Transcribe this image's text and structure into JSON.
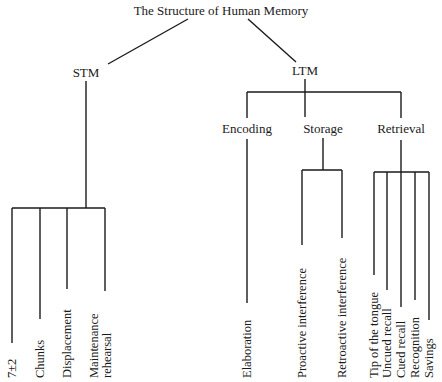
{
  "title": "The Structure of Human Memory",
  "colors": {
    "line": "#1a1a1a",
    "background": "#ffffff"
  },
  "stm": {
    "label": "STM",
    "leaves": [
      "7±2",
      "Chunks",
      "Displacement",
      "Maintenance",
      "rehearsal"
    ]
  },
  "ltm": {
    "label": "LTM",
    "encoding": {
      "label": "Encoding",
      "leaves": [
        "Elaboration"
      ]
    },
    "storage": {
      "label": "Storage",
      "leaves": [
        "Proactive interference",
        "Retroactive interference"
      ]
    },
    "retrieval": {
      "label": "Retrieval",
      "leaves": [
        "Tip of the tongue",
        "Uncued recall",
        "Cued recall",
        "Recognition",
        "Savings"
      ]
    }
  }
}
